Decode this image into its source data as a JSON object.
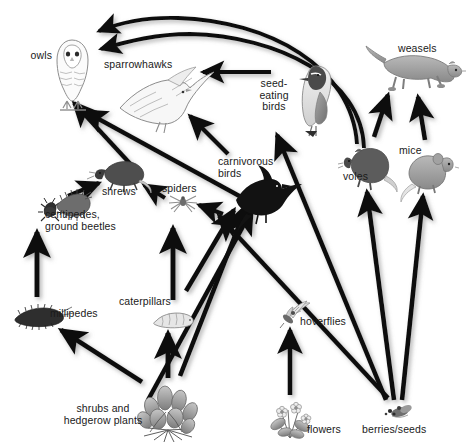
{
  "diagram": {
    "type": "food-web",
    "background_color": "#ffffff",
    "arrow_color": "#111111",
    "label_color": "#1a1a1a"
  },
  "nodes": [
    {
      "id": "owls",
      "label": "owls",
      "icon": "owl-icon",
      "trophic": "top-predator",
      "x": 50,
      "y": 57
    },
    {
      "id": "sparrowhawks",
      "label": "sparrowhawks",
      "icon": "sparrowhawk-icon",
      "trophic": "top-predator",
      "x": 143,
      "y": 66
    },
    {
      "id": "weasels",
      "label": "weasels",
      "icon": "weasel-icon",
      "trophic": "top-predator",
      "x": 424,
      "y": 50
    },
    {
      "id": "seed_eating_birds",
      "label": "seed-\neating\nbirds",
      "icon": "seed-eating-bird-icon",
      "trophic": "primary-consumer",
      "x": 281,
      "y": 97
    },
    {
      "id": "carnivorous_birds",
      "label": "carnivorous\nbirds",
      "icon": "carnivorous-bird-icon",
      "trophic": "secondary-consumer",
      "x": 254,
      "y": 172
    },
    {
      "id": "voles",
      "label": "voles",
      "icon": "vole-icon",
      "trophic": "primary-consumer",
      "x": 366,
      "y": 168
    },
    {
      "id": "mice",
      "label": "mice",
      "icon": "mouse-icon",
      "trophic": "primary-consumer",
      "x": 425,
      "y": 170
    },
    {
      "id": "shrews",
      "label": "shrews",
      "icon": "shrew-icon",
      "trophic": "secondary-consumer",
      "x": 122,
      "y": 185
    },
    {
      "id": "spiders",
      "label": "spiders",
      "icon": "spider-icon",
      "trophic": "secondary-consumer",
      "x": 182,
      "y": 190
    },
    {
      "id": "centipedes",
      "label": "centipedes,\nground beetles",
      "icon": "centipede-beetle-icon",
      "trophic": "secondary-consumer",
      "x": 80,
      "y": 212
    },
    {
      "id": "millipedes",
      "label": "millipedes",
      "icon": "millipede-icon",
      "trophic": "detritivore",
      "x": 47,
      "y": 314
    },
    {
      "id": "caterpillars",
      "label": "caterpillars",
      "icon": "caterpillar-icon",
      "trophic": "primary-consumer",
      "x": 148,
      "y": 305
    },
    {
      "id": "hoverflies",
      "label": "hoverflies",
      "icon": "hoverfly-icon",
      "trophic": "primary-consumer",
      "x": 297,
      "y": 312
    },
    {
      "id": "shrubs",
      "label": "shrubs and\nhedgerow plants",
      "icon": "shrub-icon",
      "trophic": "producer",
      "x": 108,
      "y": 415
    },
    {
      "id": "flowers",
      "label": "flowers",
      "icon": "flower-icon",
      "trophic": "producer",
      "x": 307,
      "y": 425
    },
    {
      "id": "berries",
      "label": "berries/seeds",
      "icon": "berries-seeds-icon",
      "trophic": "producer",
      "x": 398,
      "y": 427
    }
  ],
  "links": [
    {
      "from": "voles",
      "to": "owls",
      "style": "curved"
    },
    {
      "from": "voles",
      "to": "sparrowhawks",
      "style": "curved"
    },
    {
      "from": "seed_eating_birds",
      "to": "sparrowhawks",
      "style": "straight"
    },
    {
      "from": "voles",
      "to": "weasels",
      "style": "straight"
    },
    {
      "from": "mice",
      "to": "weasels",
      "style": "straight"
    },
    {
      "from": "shrews",
      "to": "owls",
      "style": "straight"
    },
    {
      "from": "carnivorous_birds",
      "to": "owls",
      "style": "straight"
    },
    {
      "from": "carnivorous_birds",
      "to": "sparrowhawks",
      "style": "straight"
    },
    {
      "from": "centipedes",
      "to": "shrews",
      "style": "straight"
    },
    {
      "from": "spiders",
      "to": "shrews",
      "style": "straight"
    },
    {
      "from": "hoverflies",
      "to": "spiders",
      "style": "straight"
    },
    {
      "from": "millipedes",
      "to": "centipedes",
      "style": "straight"
    },
    {
      "from": "caterpillars",
      "to": "spiders",
      "style": "straight"
    },
    {
      "from": "caterpillars",
      "to": "carnivorous_birds",
      "style": "straight"
    },
    {
      "from": "hoverflies",
      "to": "carnivorous_birds",
      "style": "straight"
    },
    {
      "from": "berries",
      "to": "carnivorous_birds",
      "style": "straight"
    },
    {
      "from": "berries",
      "to": "seed_eating_birds",
      "style": "straight"
    },
    {
      "from": "berries",
      "to": "voles",
      "style": "straight"
    },
    {
      "from": "berries",
      "to": "mice",
      "style": "straight"
    },
    {
      "from": "shrubs",
      "to": "millipedes",
      "style": "straight"
    },
    {
      "from": "shrubs",
      "to": "caterpillars",
      "style": "straight"
    },
    {
      "from": "shrubs",
      "to": "carnivorous_birds",
      "style": "straight"
    },
    {
      "from": "flowers",
      "to": "hoverflies",
      "style": "straight"
    }
  ]
}
